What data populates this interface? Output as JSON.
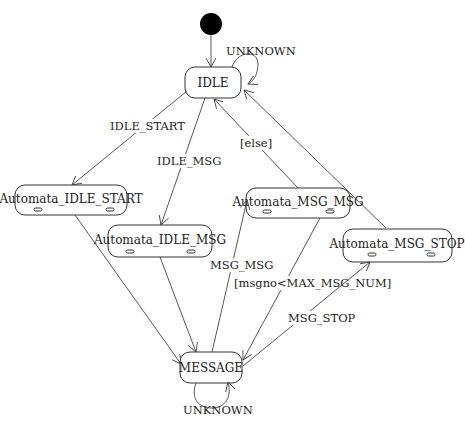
{
  "diagram": {
    "type": "state-machine",
    "initial_state": {
      "target": "IDLE"
    },
    "states": [
      {
        "id": "IDLE",
        "label": "IDLE"
      },
      {
        "id": "Automata_IDLE_START",
        "label": "Automata_IDLE_START"
      },
      {
        "id": "Automata_IDLE_MSG",
        "label": "Automata_IDLE_MSG"
      },
      {
        "id": "Automata_MSG_MSG",
        "label": "Automata_MSG_MSG"
      },
      {
        "id": "Automata_MSG_STOP",
        "label": "Automata_MSG_STOP"
      },
      {
        "id": "MESSAGE",
        "label": "MESSAGE"
      }
    ],
    "transitions": [
      {
        "from": "IDLE",
        "to": "IDLE",
        "label": "UNKNOWN"
      },
      {
        "from": "IDLE",
        "to": "Automata_IDLE_START",
        "label": "IDLE_START"
      },
      {
        "from": "IDLE",
        "to": "Automata_IDLE_MSG",
        "label": "IDLE_MSG"
      },
      {
        "from": "Automata_MSG_MSG",
        "to": "IDLE",
        "label": "[else]"
      },
      {
        "from": "Automata_MSG_STOP",
        "to": "IDLE",
        "label": ""
      },
      {
        "from": "Automata_IDLE_START",
        "to": "MESSAGE",
        "label": ""
      },
      {
        "from": "Automata_IDLE_MSG",
        "to": "MESSAGE",
        "label": ""
      },
      {
        "from": "MESSAGE",
        "to": "Automata_MSG_MSG",
        "label": "MSG_MSG"
      },
      {
        "from": "Automata_MSG_MSG",
        "to": "MESSAGE",
        "label": "[msgno<MAX_MSG_NUM]"
      },
      {
        "from": "MESSAGE",
        "to": "Automata_MSG_STOP",
        "label": "MSG_STOP"
      },
      {
        "from": "MESSAGE",
        "to": "MESSAGE",
        "label": "UNKNOWN"
      }
    ]
  },
  "labels": {
    "idle_self": "UNKNOWN",
    "idle_start": "IDLE_START",
    "idle_msg": "IDLE_MSG",
    "else": "[else]",
    "msg_msg": "MSG_MSG",
    "guard": "[msgno<MAX_MSG_NUM]",
    "msg_stop": "MSG_STOP",
    "message_self": "UNKNOWN"
  },
  "colors": {
    "stroke": "#333333",
    "initial_fill": "#000000",
    "background": "#ffffff"
  }
}
